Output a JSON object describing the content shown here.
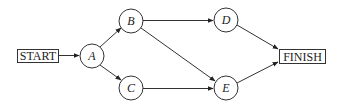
{
  "diagram": {
    "type": "network-activity-graph",
    "start": {
      "label": "START",
      "x": 17,
      "y": 49,
      "w": 41,
      "h": 13
    },
    "finish": {
      "label": "FINISH",
      "x": 279,
      "y": 49,
      "w": 46,
      "h": 14
    },
    "nodes": [
      {
        "id": "A",
        "label": "A",
        "cx": 92,
        "cy": 56,
        "r": 12
      },
      {
        "id": "B",
        "label": "B",
        "cx": 131,
        "cy": 21,
        "r": 12
      },
      {
        "id": "C",
        "label": "C",
        "cx": 131,
        "cy": 88,
        "r": 12
      },
      {
        "id": "D",
        "label": "D",
        "cx": 226,
        "cy": 20,
        "r": 12
      },
      {
        "id": "E",
        "label": "E",
        "cx": 226,
        "cy": 88,
        "r": 12
      }
    ],
    "edges": [
      {
        "from": "START",
        "to": "A"
      },
      {
        "from": "A",
        "to": "B"
      },
      {
        "from": "A",
        "to": "C"
      },
      {
        "from": "B",
        "to": "D"
      },
      {
        "from": "B",
        "to": "E"
      },
      {
        "from": "C",
        "to": "E"
      },
      {
        "from": "D",
        "to": "FINISH"
      },
      {
        "from": "E",
        "to": "FINISH"
      }
    ]
  }
}
